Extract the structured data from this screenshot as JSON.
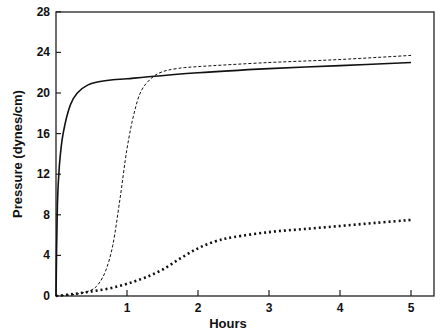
{
  "chart_data": {
    "type": "line",
    "title": "",
    "xlabel": "Hours",
    "ylabel": "Pressure (dynes/cm)",
    "xlim": [
      0,
      5.3
    ],
    "ylim": [
      0,
      30
    ],
    "x_ticks": [
      1,
      2,
      3,
      4,
      5
    ],
    "y_ticks": [
      0,
      4,
      8,
      12,
      16,
      20,
      24,
      28
    ],
    "grid": false,
    "legend": null,
    "series": [
      {
        "name": "solid",
        "style": "solid",
        "x": [
          0,
          0.02,
          0.05,
          0.1,
          0.2,
          0.3,
          0.45,
          0.6,
          0.8,
          1.0,
          1.3,
          2.0,
          3.0,
          4.0,
          5.0
        ],
        "y": [
          0,
          9,
          13,
          16,
          18.8,
          20.0,
          20.8,
          21.1,
          21.3,
          21.4,
          21.6,
          22.0,
          22.4,
          22.7,
          23.0
        ]
      },
      {
        "name": "dashed",
        "style": "dashed",
        "x": [
          0,
          0.3,
          0.5,
          0.6,
          0.7,
          0.8,
          0.9,
          1.0,
          1.1,
          1.2,
          1.35,
          1.5,
          1.7,
          2.0,
          3.0,
          4.0,
          5.0
        ],
        "y": [
          0,
          0.2,
          0.6,
          1.2,
          2.5,
          5.0,
          9.5,
          14.5,
          18.0,
          20.2,
          21.5,
          22.1,
          22.4,
          22.6,
          23.0,
          23.3,
          23.7
        ]
      },
      {
        "name": "dotted",
        "style": "dotted",
        "x": [
          0,
          0.25,
          0.5,
          0.75,
          1.0,
          1.25,
          1.5,
          1.75,
          2.0,
          2.25,
          2.5,
          3.0,
          3.5,
          4.0,
          4.5,
          5.0
        ],
        "y": [
          0,
          0.2,
          0.45,
          0.75,
          1.2,
          1.8,
          2.6,
          3.7,
          4.7,
          5.4,
          5.8,
          6.3,
          6.6,
          6.9,
          7.2,
          7.5
        ]
      }
    ]
  },
  "axes": {
    "x_title": "Hours",
    "y_title": "Pressure (dynes/cm)"
  }
}
